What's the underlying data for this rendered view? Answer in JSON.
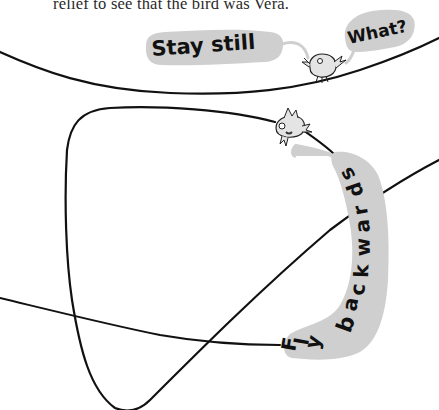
{
  "story": {
    "text_line": "relief to see that the bird was Vera."
  },
  "speech_bubbles": [
    {
      "id": "stay-still",
      "text": "Stay still",
      "speaker": "top-left"
    },
    {
      "id": "what",
      "text": "What?",
      "speaker": "bird-on-top-line"
    },
    {
      "id": "fly-backwards",
      "text": "Fly backwards",
      "letters": [
        "F",
        "l",
        "y",
        "b",
        "a",
        "c",
        "k",
        "w",
        "a",
        "r",
        "d",
        "s"
      ],
      "speaker": "bird-on-loop-line"
    }
  ],
  "colors": {
    "background": "#ffffff",
    "line": "#111111",
    "bubble_fill": "#cfcfcf",
    "text": "#2a2a2a",
    "bird_fill": "#e4e4e4"
  },
  "illustration": {
    "birds": [
      {
        "name": "bird-top",
        "position": "on upper line, right"
      },
      {
        "name": "bird-vera",
        "position": "on loop line, upper right"
      }
    ]
  }
}
